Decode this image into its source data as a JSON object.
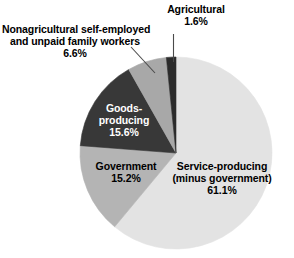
{
  "chart_data": {
    "type": "pie",
    "title": "",
    "subtitle": "",
    "xlabel": "",
    "ylabel": "",
    "grid": false,
    "legend_position": "none",
    "units": "percent",
    "start_angle_deg": 0,
    "direction": "clockwise",
    "categories": [
      "Service-producing (minus government)",
      "Government",
      "Goods-producing",
      "Nonagricultural self-employed and unpaid family workers",
      "Agricultural"
    ],
    "values": [
      61.1,
      15.2,
      15.6,
      6.6,
      1.6
    ],
    "colors": [
      "#e3e3e3",
      "#b4b4b4",
      "#383838",
      "#a8a8a8",
      "#2b2b2b"
    ],
    "slices": [
      {
        "name": "Service-producing (minus government)",
        "label_line1": "Service-producing",
        "label_line2": "(minus government)",
        "value": 61.1,
        "value_label": "61.1%",
        "color": "#e3e3e3",
        "label_color": "#000000",
        "label_placement": "inside"
      },
      {
        "name": "Government",
        "label_line1": "Government",
        "label_line2": "",
        "value": 15.2,
        "value_label": "15.2%",
        "color": "#b4b4b4",
        "label_color": "#000000",
        "label_placement": "inside"
      },
      {
        "name": "Goods-producing",
        "label_line1": "Goods-",
        "label_line2": "producing",
        "value": 15.6,
        "value_label": "15.6%",
        "color": "#383838",
        "label_color": "#ffffff",
        "label_placement": "inside"
      },
      {
        "name": "Nonagricultural self-employed and unpaid family workers",
        "label_line1": "Nonagricultural self-employed",
        "label_line2": "and unpaid family workers",
        "value": 6.6,
        "value_label": "6.6%",
        "color": "#a8a8a8",
        "label_color": "#000000",
        "label_placement": "callout-left"
      },
      {
        "name": "Agricultural",
        "label_line1": "Agricultural",
        "label_line2": "",
        "value": 1.6,
        "value_label": "1.6%",
        "color": "#2b2b2b",
        "label_color": "#000000",
        "label_placement": "callout-top"
      }
    ]
  },
  "labels": {
    "agricultural": {
      "name": "Agricultural",
      "percent": "1.6%"
    },
    "nonagricultural": {
      "line1": "Nonagricultural self-employed",
      "line2": "and unpaid family workers",
      "percent": "6.6%"
    },
    "goods_producing": {
      "line1": "Goods-",
      "line2": "producing",
      "percent": "15.6%"
    },
    "government": {
      "name": "Government",
      "percent": "15.2%"
    },
    "service_producing": {
      "line1": "Service-producing",
      "line2": "(minus government)",
      "percent": "61.1%"
    }
  }
}
